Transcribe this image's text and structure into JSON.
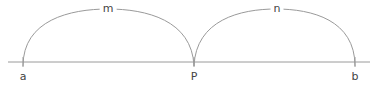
{
  "diagram": {
    "colors": {
      "line": "#9a9a9a",
      "text": "#444444",
      "background": "#ffffff"
    },
    "baseline": {
      "y": 62,
      "x1": 8,
      "x2": 370
    },
    "points": [
      {
        "label": "a",
        "x": 23
      },
      {
        "label": "P",
        "x": 194
      },
      {
        "label": "b",
        "x": 355
      }
    ],
    "arcs": [
      {
        "label": "m",
        "from": "a",
        "to": "P"
      },
      {
        "label": "n",
        "from": "P",
        "to": "b"
      }
    ]
  }
}
